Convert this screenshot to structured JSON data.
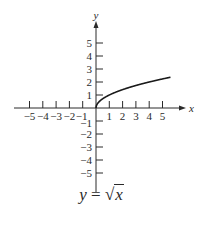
{
  "chart_data": {
    "type": "line",
    "title": "",
    "caption": "y = √x",
    "caption_parts": {
      "lhs": "y",
      "equals": "=",
      "radical": "√",
      "radicand": "x"
    },
    "xlabel": "x",
    "ylabel": "y",
    "xlim": [
      -6,
      6
    ],
    "ylim": [
      -6,
      6.5
    ],
    "x_ticks": [
      -5,
      -4,
      -3,
      -2,
      -1,
      1,
      2,
      3,
      4,
      5
    ],
    "y_ticks": [
      -5,
      -4,
      -3,
      -2,
      -1,
      1,
      2,
      3,
      4,
      5
    ],
    "x_tick_labels": [
      "−5",
      "−4",
      "−3",
      "−2",
      "−1",
      "1",
      "2",
      "3",
      "4",
      "5"
    ],
    "y_tick_labels": [
      "−5",
      "−4",
      "−3",
      "−2",
      "−1",
      "1",
      "2",
      "3",
      "4",
      "5"
    ],
    "grid": false,
    "legend": null,
    "series": [
      {
        "name": "y = sqrt(x)",
        "x": [
          0,
          0.05,
          0.25,
          0.5,
          1,
          1.5,
          2,
          2.5,
          3,
          3.5,
          4,
          4.5,
          5,
          5.6
        ],
        "y": [
          0,
          0.224,
          0.5,
          0.707,
          1,
          1.225,
          1.414,
          1.581,
          1.732,
          1.871,
          2,
          2.121,
          2.236,
          2.366
        ]
      }
    ],
    "colors": {
      "axis": "#2a2a2a",
      "curve": "#1a1a1a"
    }
  }
}
